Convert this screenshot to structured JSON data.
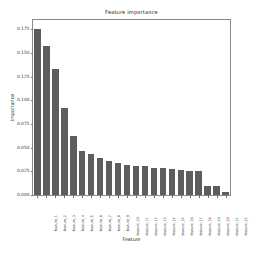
{
  "chart_data": {
    "type": "bar",
    "title": "Feature Importance",
    "xlabel": "Feature",
    "ylabel": "Importance",
    "ylim": [
      0.0,
      0.185
    ],
    "yticks": [
      0.0,
      0.025,
      0.05,
      0.075,
      0.1,
      0.125,
      0.15,
      0.175
    ],
    "ytick_labels": [
      "0.000",
      "0.025",
      "0.050",
      "0.075",
      "0.100",
      "0.125",
      "0.150",
      "0.175"
    ],
    "grid": false,
    "legend": null,
    "bar_color": "#5d5d5d",
    "categories": [
      "feature_1",
      "feature_2",
      "feature_3",
      "feature_4",
      "feature_5",
      "feature_6",
      "feature_7",
      "feature_8",
      "feature_9",
      "feature_10",
      "feature_11",
      "feature_12",
      "feature_13",
      "feature_14",
      "feature_15",
      "feature_16",
      "feature_17",
      "feature_18",
      "feature_19",
      "feature_20",
      "feature_21",
      "feature_22"
    ],
    "values": [
      0.176,
      0.158,
      0.133,
      0.0925,
      0.062,
      0.047,
      0.0432,
      0.039,
      0.036,
      0.0338,
      0.0318,
      0.0305,
      0.0302,
      0.0288,
      0.0285,
      0.0272,
      0.0262,
      0.0258,
      0.0252,
      0.01,
      0.0098,
      0.0035
    ]
  }
}
